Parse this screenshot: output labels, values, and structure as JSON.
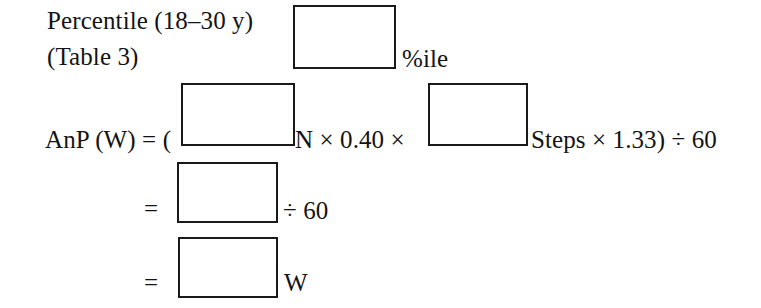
{
  "document": {
    "type": "worksheet-formula",
    "title": "Anaerobic Power (AnP) calculation worksheet",
    "ink_color": "#131313",
    "paper_color": "#ffffff"
  },
  "lines": {
    "percentile_label": "Percentile (18–30 y)",
    "table_reference": "(Table 3)",
    "percentile_unit": "%ile",
    "equation_lhs": "AnP (W) = (",
    "equation_mid": "N × 0.40 ×",
    "equation_tail": "Steps × 1.33) ÷ 60",
    "equals_1": "=",
    "divide_60": "÷ 60",
    "equals_2": "=",
    "watts_unit": "W"
  },
  "answer_boxes": [
    {
      "name": "percentile-value",
      "value": "",
      "placeholder": "",
      "unit": "%ile"
    },
    {
      "name": "body-mass-n",
      "value": "",
      "placeholder": "",
      "unit": "N"
    },
    {
      "name": "step-count",
      "value": "",
      "placeholder": "",
      "unit": "Steps"
    },
    {
      "name": "subtotal",
      "value": "",
      "placeholder": "",
      "unit": ""
    },
    {
      "name": "anaerobic-power",
      "value": "",
      "placeholder": "",
      "unit": "W"
    }
  ],
  "constants": {
    "stair_factor": "0.40",
    "step_factor": "1.33",
    "time_divisor": "60"
  }
}
